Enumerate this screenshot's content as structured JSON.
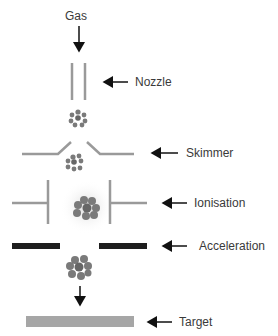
{
  "diagram": {
    "input_label": "Gas",
    "stages": [
      {
        "id": "nozzle",
        "label": "Nozzle"
      },
      {
        "id": "skimmer",
        "label": "Skimmer"
      },
      {
        "id": "ionisation",
        "label": "Ionisation"
      },
      {
        "id": "acceleration",
        "label": "Acceleration"
      },
      {
        "id": "target",
        "label": "Target"
      }
    ],
    "colors": {
      "component_gray": "#9a9a9a",
      "acceleration_plate": "#1e1e1e",
      "target_plate": "#a6a6a6",
      "cluster": "#7a7a7a",
      "arrow": "#111111"
    }
  }
}
